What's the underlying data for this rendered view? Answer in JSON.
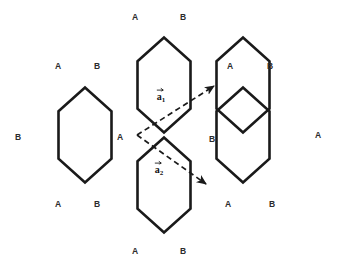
{
  "figure": {
    "background_color": "#ffffff",
    "bond_color": "#1a1a1a",
    "label_color": "#2b2b2b",
    "vector_color": "#1a1a1a",
    "width": 338,
    "height": 268
  },
  "sublattice_labels": [
    {
      "id": "top-outer-a",
      "text": "A",
      "x": 135,
      "y": 17
    },
    {
      "id": "top-outer-b",
      "text": "B",
      "x": 183,
      "y": 17
    },
    {
      "id": "upper-left-a",
      "text": "A",
      "x": 58,
      "y": 66
    },
    {
      "id": "upper-left-b",
      "text": "B",
      "x": 97,
      "y": 66
    },
    {
      "id": "upper-right-a",
      "text": "A",
      "x": 230,
      "y": 66
    },
    {
      "id": "upper-right-b",
      "text": "B",
      "x": 270,
      "y": 66
    },
    {
      "id": "far-left-b",
      "text": "B",
      "x": 18,
      "y": 137
    },
    {
      "id": "center-a",
      "text": "A",
      "x": 120,
      "y": 137
    },
    {
      "id": "center-b",
      "text": "B",
      "x": 212,
      "y": 139
    },
    {
      "id": "far-right-a",
      "text": "A",
      "x": 318,
      "y": 135
    },
    {
      "id": "lower-left-a",
      "text": "A",
      "x": 58,
      "y": 204
    },
    {
      "id": "lower-left-b",
      "text": "B",
      "x": 97,
      "y": 204
    },
    {
      "id": "lower-right-a",
      "text": "A",
      "x": 228,
      "y": 204
    },
    {
      "id": "lower-right-b",
      "text": "B",
      "x": 272,
      "y": 204
    },
    {
      "id": "bottom-outer-a",
      "text": "A",
      "x": 135,
      "y": 251
    },
    {
      "id": "bottom-outer-b",
      "text": "B",
      "x": 183,
      "y": 251
    }
  ],
  "lattice_vectors": [
    {
      "id": "a1",
      "base_symbol": "a",
      "subscript": "1",
      "origin_x": 137,
      "origin_y": 135,
      "tip_x": 214,
      "tip_y": 86,
      "label_x": 161,
      "label_y": 95,
      "style": "dashed"
    },
    {
      "id": "a2",
      "base_symbol": "a",
      "subscript": "2",
      "origin_x": 137,
      "origin_y": 135,
      "tip_x": 206,
      "tip_y": 184,
      "label_x": 159,
      "label_y": 168,
      "style": "dashed"
    }
  ],
  "hexagons": [
    {
      "id": "hex-top",
      "cx": 164,
      "cy": 85,
      "rx": 26.5,
      "ry": 47.5
    },
    {
      "id": "hex-left",
      "cx": 85,
      "cy": 135,
      "rx": 26.5,
      "ry": 47.5
    },
    {
      "id": "hex-right-upper",
      "cx": 243,
      "cy": 85,
      "rx": 26.5,
      "ry": 47.5
    },
    {
      "id": "hex-center-right",
      "cx": 243,
      "cy": 135,
      "rx": 26.5,
      "ry": 47.5
    },
    {
      "id": "hex-bottom",
      "cx": 164,
      "cy": 185,
      "rx": 26.5,
      "ry": 47.5
    }
  ]
}
